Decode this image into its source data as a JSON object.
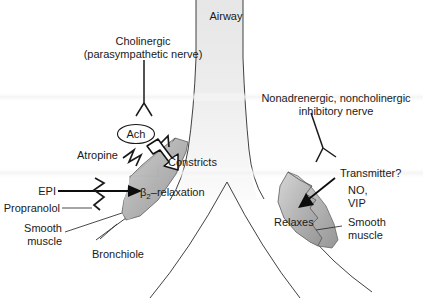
{
  "figure": {
    "width": 423,
    "height": 299
  },
  "colors": {
    "background": "#ffffff",
    "airway_fill_top": "#e8e8e8",
    "airway_fill_bottom": "#f7f7f7",
    "muscle_fill_light": "#c9c9c9",
    "muscle_fill_dark": "#9e9e9e",
    "outline": "#2b2b2b",
    "text": "#1a1a1a"
  },
  "labels": {
    "airway": "Airway",
    "cholinergic_line1": "Cholinergic",
    "cholinergic_line2": "(parasympathetic nerve)",
    "ach": "Ach",
    "atropine": "Atropine",
    "constricts": "Constricts",
    "epi": "EPI",
    "propranolol": "Propranolol",
    "beta2_relaxation_prefix": "β",
    "beta2_relaxation_sub": "2",
    "beta2_relaxation_suffix": "–relaxation",
    "smooth_muscle_left_line1": "Smooth",
    "smooth_muscle_left_line2": "muscle",
    "bronchiole": "Bronchiole",
    "nanc_line1": "Nonadrenergic, noncholinergic",
    "nanc_line2": "inhibitory nerve",
    "transmitter": "Transmitter?",
    "no": "NO,",
    "vip": "VIP",
    "relaxes": "Relaxes",
    "smooth_muscle_right_line1": "Smooth",
    "smooth_muscle_right_line2": "muscle"
  },
  "icons": {
    "cholinergic_nerve": "nerve-fork-icon",
    "nanc_nerve": "nerve-fork-icon",
    "ach_vesicle": "neurotransmitter-vesicle-icon",
    "atropine_block": "zigzag-block-icon",
    "propranolol_block": "zigzag-block-icon",
    "constrict_arrow": "constriction-arrow-icon",
    "epi_arrow": "stimulation-arrow-icon",
    "transmitter_arrow": "relaxation-arrow-icon"
  }
}
